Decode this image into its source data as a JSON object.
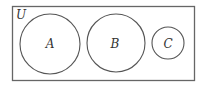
{
  "diagram": {
    "type": "venn",
    "universe": {
      "label": "U"
    },
    "sets": [
      {
        "label": "A"
      },
      {
        "label": "B"
      },
      {
        "label": "C"
      }
    ],
    "stroke_color": "#555555"
  }
}
